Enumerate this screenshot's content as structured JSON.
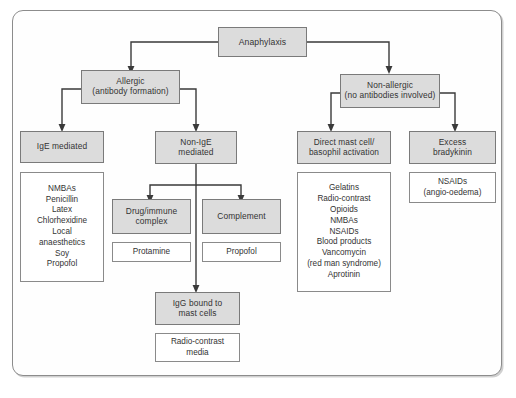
{
  "figure": {
    "caption": "",
    "border_color": "#8c8c8c",
    "shaded_fill": "#dcdcdc",
    "plain_fill": "#ffffff"
  },
  "nodes": {
    "anaphylaxis": {
      "label": "Anaphylaxis"
    },
    "allergic": {
      "line1": "Allergic",
      "line2": "(antibody formation)"
    },
    "non_allergic": {
      "line1": "Non-allergic",
      "line2": "(no antibodies involved)"
    },
    "ige_mediated": {
      "label": "IgE mediated"
    },
    "non_ige_mediated": {
      "line1": "Non-IgE",
      "line2": "mediated"
    },
    "direct_mast_cell": {
      "line1": "Direct mast cell/",
      "line2": "basophil activation"
    },
    "excess_bradykinin": {
      "line1": "Excess",
      "line2": "bradykinin"
    },
    "drug_immune_complex": {
      "line1": "Drug/immune",
      "line2": "complex"
    },
    "complement": {
      "label": "Complement"
    },
    "igg_bound": {
      "line1": "IgG bound to",
      "line2": "mast cells"
    }
  },
  "lists": {
    "ige_agents": {
      "items": [
        "NMBAs",
        "Penicillin",
        "Latex",
        "Chlorhexidine",
        "Local",
        "anaesthetics",
        "Soy",
        "Propofol"
      ]
    },
    "protamine": {
      "items": [
        "Protamine"
      ]
    },
    "propofol": {
      "items": [
        "Propofol"
      ]
    },
    "radio_contrast": {
      "items": [
        "Radio-contrast",
        "media"
      ]
    },
    "direct_agents": {
      "items": [
        "Gelatins",
        "Radio-contrast",
        "Opioids",
        "NMBAs",
        "NSAIDs",
        "Blood products",
        "Vancomycin",
        "(red man syndrome)",
        "Aprotinin"
      ]
    },
    "bradykinin_agents": {
      "items": [
        "NSAIDs",
        "(angio-oedema)"
      ]
    }
  },
  "edges": [
    {
      "from": "anaphylaxis",
      "to": "allergic"
    },
    {
      "from": "anaphylaxis",
      "to": "non_allergic"
    },
    {
      "from": "allergic",
      "to": "ige_mediated"
    },
    {
      "from": "allergic",
      "to": "non_ige_mediated"
    },
    {
      "from": "non_allergic",
      "to": "direct_mast_cell"
    },
    {
      "from": "non_allergic",
      "to": "excess_bradykinin"
    },
    {
      "from": "non_ige_mediated",
      "to": "drug_immune_complex"
    },
    {
      "from": "non_ige_mediated",
      "to": "complement"
    },
    {
      "from": "non_ige_mediated",
      "to": "igg_bound"
    }
  ]
}
